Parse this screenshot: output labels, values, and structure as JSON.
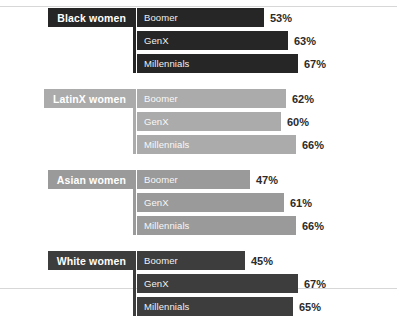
{
  "chart_data": {
    "type": "bar",
    "title": "",
    "xlabel": "",
    "ylabel": "",
    "xlim": [
      0,
      75
    ],
    "grid": false,
    "legend": "none",
    "orientation": "horizontal",
    "categories": [
      "Boomer",
      "GenX",
      "Millennials"
    ],
    "groups": [
      {
        "name": "Black women",
        "color": "#262626",
        "label_color": "#262626",
        "series": [
          {
            "name": "Boomer",
            "value": 53,
            "value_label": "53%"
          },
          {
            "name": "GenX",
            "value": 63,
            "value_label": "63%"
          },
          {
            "name": "Millennials",
            "value": 67,
            "value_label": "67%"
          }
        ]
      },
      {
        "name": "LatinX women",
        "color": "#ababab",
        "label_color": "#ababab",
        "series": [
          {
            "name": "Boomer",
            "value": 62,
            "value_label": "62%"
          },
          {
            "name": "GenX",
            "value": 60,
            "value_label": "60%"
          },
          {
            "name": "Millennials",
            "value": 66,
            "value_label": "66%"
          }
        ]
      },
      {
        "name": "Asian women",
        "color": "#9a9a9a",
        "label_color": "#9a9a9a",
        "series": [
          {
            "name": "Boomer",
            "value": 47,
            "value_label": "47%"
          },
          {
            "name": "GenX",
            "value": 61,
            "value_label": "61%"
          },
          {
            "name": "Millennials",
            "value": 66,
            "value_label": "66%"
          }
        ]
      },
      {
        "name": "White women",
        "color": "#3d3d3d",
        "label_color": "#3d3d3d",
        "series": [
          {
            "name": "Boomer",
            "value": 45,
            "value_label": "45%"
          },
          {
            "name": "GenX",
            "value": 67,
            "value_label": "67%"
          },
          {
            "name": "Millennials",
            "value": 65,
            "value_label": "65%"
          }
        ]
      }
    ]
  },
  "layout": {
    "border_color": "#d7d7d7",
    "background": "#ffffff",
    "bar_origin_x": 137,
    "bar_max_x": 298,
    "value_scale_max": 67
  }
}
